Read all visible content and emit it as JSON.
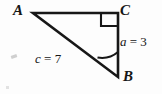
{
  "figure": {
    "type": "right-triangle-diagram",
    "background_color": "#fdfdfd",
    "stroke_color": "#171717",
    "vertices": {
      "a": {
        "label": "A",
        "x": 33,
        "y": 13
      },
      "b": {
        "label": "B",
        "x": 118,
        "y": 77
      },
      "c": {
        "label": "C",
        "x": 118,
        "y": 13
      }
    },
    "sides": {
      "a": {
        "label": "a = 3",
        "variable": "a",
        "equals": "=",
        "value": "3",
        "between": "B-C"
      },
      "c": {
        "label": "c = 7",
        "variable": "c",
        "equals": "=",
        "value": "7",
        "between": "A-B"
      }
    },
    "markers": {
      "right_angle": {
        "at": "C",
        "symbol": "square",
        "size": 16
      },
      "angle_arc": {
        "at": "B",
        "radius": 25
      }
    },
    "geometry": {
      "triangle_points": "33,13 118,13 118,77",
      "right_angle_path": "M 101,13 L 101,26 L 118,26",
      "arc_path": "M 118,52 A 25,25 0 0 1 97.5,57.5"
    }
  }
}
